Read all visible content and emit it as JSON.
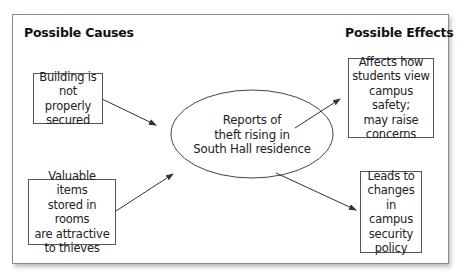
{
  "headings": {
    "causes": "Possible Causes",
    "effects": "Possible Effects"
  },
  "center": {
    "lines": [
      "Reports of",
      "theft rising in",
      "South Hall residence"
    ]
  },
  "causes": [
    {
      "lines": [
        "Building is",
        "not properly",
        "secured"
      ]
    },
    {
      "lines": [
        "Valuable items",
        "stored in rooms",
        "are attractive",
        "to thieves"
      ]
    }
  ],
  "effects": [
    {
      "lines": [
        "Affects how",
        "students view",
        "campus safety;",
        "may raise",
        "concerns"
      ]
    },
    {
      "lines": [
        "Leads to",
        "changes",
        "in campus",
        "security",
        "policy"
      ]
    }
  ],
  "colors": {
    "line": "#333333",
    "frame": "#8a8a8a"
  }
}
